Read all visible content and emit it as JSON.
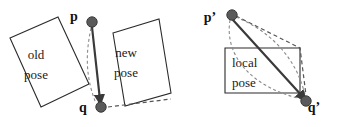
{
  "figure": {
    "width": 340,
    "height": 127,
    "background_color": "#ffffff",
    "colors": {
      "outline": "#2b2b2b",
      "solid_vector": "#3a3a3a",
      "dashed_light": "#8a8a8a",
      "dashed_dark": "#555555",
      "dot_fill": "#5a5a5a",
      "text": "#111111"
    }
  },
  "left_panel": {
    "name": "global-frame-panel",
    "boxes": [
      {
        "id": "old-pose-box",
        "label_line1": "old",
        "label_line2": "pose",
        "points": "10,38 58,17 89,84 41,107",
        "label_x": 36,
        "label_y1": 59,
        "label_y2": 79
      },
      {
        "id": "new-pose-box",
        "label_line1": "new",
        "label_line2": "pose",
        "points": "113,33 159,19 171,93 125,106",
        "label_x": 126,
        "label_y1": 57,
        "label_y2": 77
      }
    ],
    "points": [
      {
        "id": "p-point",
        "label": "p",
        "cx": 92,
        "cy": 22,
        "r": 5.2,
        "label_x": 74,
        "label_y": 21
      },
      {
        "id": "q-point",
        "label": "q",
        "cx": 101,
        "cy": 107,
        "r": 5.2,
        "label_x": 83,
        "label_y": 112
      }
    ],
    "solid_vector": {
      "id": "p-to-q-vector",
      "path": "M 92 27 L 100 100"
    },
    "dashed_from_p": {
      "id": "p-dashed-guide",
      "path": "M 91 28 C 86 52 85 74 95 101"
    },
    "dashed_from_q": {
      "id": "q-horizontal-dashed",
      "path": "M 108 107 L 171 99"
    }
  },
  "right_panel": {
    "name": "local-frame-panel",
    "boxes": [
      {
        "id": "local-pose-box",
        "label_line1": "local",
        "label_line2": "pose",
        "points": "225,48 300,48 300,93 225,93",
        "label_x": 232,
        "label_y1": 67,
        "label_y2": 87
      }
    ],
    "points": [
      {
        "id": "p-prime-point",
        "label": "p’",
        "cx": 232,
        "cy": 15,
        "r": 5.2,
        "label_x": 210,
        "label_y": 22
      },
      {
        "id": "q-prime-point",
        "label": "q’",
        "cx": 306,
        "cy": 101,
        "r": 5.2,
        "label_x": 314,
        "label_y": 112
      }
    ],
    "solid_vector": {
      "id": "p-prime-to-q-prime-vector",
      "path": "M 233 20 L 303 97"
    },
    "dashed_polyline": {
      "id": "p-prime-dashed-polyline",
      "path": "M 236 16 L 300 48 L 306 95"
    },
    "dashed_curve_outer": {
      "id": "p-prime-outer-dashed-curve",
      "path": "M 236 17 C 268 30 296 56 305 95"
    },
    "dashed_curve_inner": {
      "id": "p-prime-inner-dashed-curve",
      "path": "M 230 20 C 224 56 252 88 302 99"
    }
  }
}
